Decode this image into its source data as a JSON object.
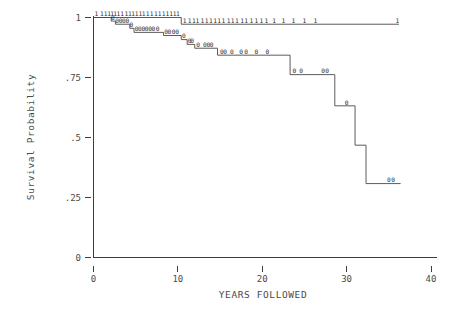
{
  "chart_data": {
    "type": "line",
    "title": "",
    "subtitle": "",
    "xlabel": "YEARS  FOLLOWED",
    "ylabel": "Survival Probability",
    "xlim": [
      0,
      40
    ],
    "ylim": [
      0,
      1
    ],
    "grid": false,
    "legend": "none",
    "xticks": [
      0,
      10,
      20,
      30,
      40
    ],
    "xticklabels": [
      "0",
      "10",
      "20",
      "30",
      "40"
    ],
    "yticks": [
      0,
      0.25,
      0.5,
      0.75,
      1
    ],
    "yticklabels": [
      "0",
      ".25",
      ".5",
      ".75",
      "1"
    ],
    "series": [
      {
        "name": "group-1-upper",
        "censor_glyph": "1",
        "steps": [
          {
            "x": 0.0,
            "y": 1.0
          },
          {
            "x": 10.4,
            "y": 1.0
          },
          {
            "x": 10.4,
            "y": 0.972
          },
          {
            "x": 36.2,
            "y": 0.972
          }
        ],
        "censor_marks": [
          {
            "x": 0.35,
            "y": 1.0
          },
          {
            "x": 1.0,
            "y": 1.0
          },
          {
            "x": 1.45,
            "y": 1.0
          },
          {
            "x": 1.85,
            "y": 1.0
          },
          {
            "x": 2.2,
            "y": 1.0
          },
          {
            "x": 2.55,
            "y": 1.0
          },
          {
            "x": 2.95,
            "y": 1.0
          },
          {
            "x": 3.4,
            "y": 1.0
          },
          {
            "x": 3.9,
            "y": 1.0
          },
          {
            "x": 4.3,
            "y": 1.0
          },
          {
            "x": 4.7,
            "y": 1.0
          },
          {
            "x": 5.1,
            "y": 1.0
          },
          {
            "x": 5.55,
            "y": 1.0
          },
          {
            "x": 5.95,
            "y": 1.0
          },
          {
            "x": 6.4,
            "y": 1.0
          },
          {
            "x": 6.9,
            "y": 1.0
          },
          {
            "x": 7.4,
            "y": 1.0
          },
          {
            "x": 7.85,
            "y": 1.0
          },
          {
            "x": 8.3,
            "y": 1.0
          },
          {
            "x": 8.75,
            "y": 1.0
          },
          {
            "x": 9.2,
            "y": 1.0
          },
          {
            "x": 9.6,
            "y": 1.0
          },
          {
            "x": 10.0,
            "y": 1.0
          },
          {
            "x": 10.8,
            "y": 0.972
          },
          {
            "x": 11.4,
            "y": 0.972
          },
          {
            "x": 11.9,
            "y": 0.972
          },
          {
            "x": 12.3,
            "y": 0.972
          },
          {
            "x": 12.9,
            "y": 0.972
          },
          {
            "x": 13.4,
            "y": 0.972
          },
          {
            "x": 13.9,
            "y": 0.972
          },
          {
            "x": 14.4,
            "y": 0.972
          },
          {
            "x": 14.9,
            "y": 0.972
          },
          {
            "x": 15.4,
            "y": 0.972
          },
          {
            "x": 16.0,
            "y": 0.972
          },
          {
            "x": 16.5,
            "y": 0.972
          },
          {
            "x": 17.0,
            "y": 0.972
          },
          {
            "x": 17.6,
            "y": 0.972
          },
          {
            "x": 18.1,
            "y": 0.972
          },
          {
            "x": 18.7,
            "y": 0.972
          },
          {
            "x": 19.3,
            "y": 0.972
          },
          {
            "x": 19.9,
            "y": 0.972
          },
          {
            "x": 20.5,
            "y": 0.972
          },
          {
            "x": 21.4,
            "y": 0.972
          },
          {
            "x": 22.5,
            "y": 0.972
          },
          {
            "x": 23.7,
            "y": 0.972
          },
          {
            "x": 25.0,
            "y": 0.972
          },
          {
            "x": 26.3,
            "y": 0.972
          },
          {
            "x": 36.0,
            "y": 0.972
          }
        ]
      },
      {
        "name": "group-0-lower",
        "censor_glyph": "0",
        "steps": [
          {
            "x": 0.0,
            "y": 1.0
          },
          {
            "x": 2.1,
            "y": 1.0
          },
          {
            "x": 2.1,
            "y": 0.985
          },
          {
            "x": 2.6,
            "y": 0.985
          },
          {
            "x": 2.6,
            "y": 0.972
          },
          {
            "x": 4.3,
            "y": 0.972
          },
          {
            "x": 4.3,
            "y": 0.955
          },
          {
            "x": 4.8,
            "y": 0.955
          },
          {
            "x": 4.8,
            "y": 0.938
          },
          {
            "x": 8.3,
            "y": 0.938
          },
          {
            "x": 8.3,
            "y": 0.925
          },
          {
            "x": 10.4,
            "y": 0.925
          },
          {
            "x": 10.4,
            "y": 0.908
          },
          {
            "x": 11.1,
            "y": 0.908
          },
          {
            "x": 11.1,
            "y": 0.888
          },
          {
            "x": 12.0,
            "y": 0.888
          },
          {
            "x": 12.0,
            "y": 0.872
          },
          {
            "x": 14.7,
            "y": 0.872
          },
          {
            "x": 14.7,
            "y": 0.843
          },
          {
            "x": 23.3,
            "y": 0.843
          },
          {
            "x": 23.3,
            "y": 0.762
          },
          {
            "x": 28.6,
            "y": 0.762
          },
          {
            "x": 28.6,
            "y": 0.632
          },
          {
            "x": 31.0,
            "y": 0.632
          },
          {
            "x": 31.0,
            "y": 0.468
          },
          {
            "x": 32.3,
            "y": 0.468
          },
          {
            "x": 32.3,
            "y": 0.308
          },
          {
            "x": 36.4,
            "y": 0.308
          }
        ],
        "censor_marks": [
          {
            "x": 2.3,
            "y": 0.985
          },
          {
            "x": 2.8,
            "y": 0.972
          },
          {
            "x": 3.2,
            "y": 0.972
          },
          {
            "x": 3.6,
            "y": 0.972
          },
          {
            "x": 4.0,
            "y": 0.972
          },
          {
            "x": 4.5,
            "y": 0.955
          },
          {
            "x": 5.1,
            "y": 0.938
          },
          {
            "x": 5.5,
            "y": 0.938
          },
          {
            "x": 5.9,
            "y": 0.938
          },
          {
            "x": 6.3,
            "y": 0.938
          },
          {
            "x": 6.7,
            "y": 0.938
          },
          {
            "x": 7.1,
            "y": 0.938
          },
          {
            "x": 7.6,
            "y": 0.938
          },
          {
            "x": 8.6,
            "y": 0.925
          },
          {
            "x": 9.0,
            "y": 0.925
          },
          {
            "x": 9.5,
            "y": 0.925
          },
          {
            "x": 9.9,
            "y": 0.925
          },
          {
            "x": 10.7,
            "y": 0.908
          },
          {
            "x": 11.4,
            "y": 0.888
          },
          {
            "x": 11.7,
            "y": 0.888
          },
          {
            "x": 12.4,
            "y": 0.872
          },
          {
            "x": 13.2,
            "y": 0.872
          },
          {
            "x": 13.6,
            "y": 0.872
          },
          {
            "x": 14.0,
            "y": 0.872
          },
          {
            "x": 15.2,
            "y": 0.843
          },
          {
            "x": 15.6,
            "y": 0.843
          },
          {
            "x": 16.4,
            "y": 0.843
          },
          {
            "x": 17.5,
            "y": 0.843
          },
          {
            "x": 18.1,
            "y": 0.843
          },
          {
            "x": 19.3,
            "y": 0.843
          },
          {
            "x": 20.6,
            "y": 0.843
          },
          {
            "x": 23.8,
            "y": 0.762
          },
          {
            "x": 24.6,
            "y": 0.762
          },
          {
            "x": 27.2,
            "y": 0.762
          },
          {
            "x": 27.7,
            "y": 0.762
          },
          {
            "x": 30.0,
            "y": 0.632
          },
          {
            "x": 35.0,
            "y": 0.308
          },
          {
            "x": 35.5,
            "y": 0.308
          }
        ]
      }
    ]
  },
  "axes": {
    "y_title": "Survival Probability",
    "x_title": "YEARS  FOLLOWED"
  }
}
